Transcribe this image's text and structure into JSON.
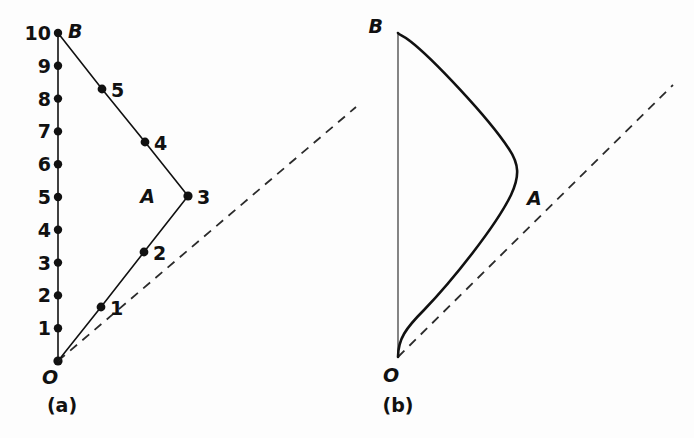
{
  "figure": {
    "background_color": "#fdfdfd",
    "ink_color": "#111111",
    "panels": [
      {
        "id": "a",
        "caption": "(a)",
        "caption_pos": {
          "x": 62,
          "y": 412
        },
        "axis": {
          "x": 58,
          "y_top": 33,
          "y_bottom": 361,
          "unit_px": 32.8
        },
        "tick_labels": [
          "10",
          "9",
          "8",
          "7",
          "6",
          "5",
          "4",
          "3",
          "2",
          "1"
        ],
        "tick_values": [
          10,
          9,
          8,
          7,
          6,
          5,
          4,
          3,
          2,
          1
        ],
        "vertices": [
          {
            "name": "O",
            "label": "O",
            "x": 58,
            "y": 361,
            "label_x": 50,
            "label_y": 384,
            "show_dot": true
          },
          {
            "name": "B",
            "label": "B",
            "x": 58,
            "y": 33,
            "label_x": 68,
            "label_y": 36,
            "show_dot": true
          },
          {
            "name": "A",
            "label": "A",
            "x": 188,
            "y": 196,
            "label_x": 155,
            "label_y": 202,
            "show_dot": true
          }
        ],
        "path_points": [
          {
            "label": "1",
            "x": 101,
            "y": 307,
            "label_x": 110,
            "label_y": 315
          },
          {
            "label": "2",
            "x": 144,
            "y": 252,
            "label_x": 153,
            "label_y": 260
          },
          {
            "label": "3",
            "x": 188,
            "y": 196,
            "label_x": 197,
            "label_y": 203
          },
          {
            "label": "4",
            "x": 145,
            "y": 142,
            "label_x": 154,
            "label_y": 149
          },
          {
            "label": "5",
            "x": 102,
            "y": 89,
            "label_x": 111,
            "label_y": 97
          }
        ],
        "polyline": "58,361 101,307 144,252 188,196 145,142 102,89 58,33",
        "dashed_line": {
          "x1": 58,
          "y1": 361,
          "x2": 356,
          "y2": 107
        }
      },
      {
        "id": "b",
        "caption": "(b)",
        "caption_pos": {
          "x": 398,
          "y": 412
        },
        "axis": {
          "x": 398,
          "y_top": 33,
          "y_bottom": 357
        },
        "vertices": [
          {
            "name": "O",
            "label": "O",
            "x": 398,
            "y": 357,
            "label_x": 389,
            "label_y": 381,
            "show_dot": false
          },
          {
            "name": "B",
            "label": "B",
            "x": 398,
            "y": 33,
            "label_x": 375,
            "label_y": 30,
            "show_dot": false
          },
          {
            "name": "A",
            "label": "A",
            "x": 517,
            "y": 176,
            "label_x": 527,
            "label_y": 205,
            "show_dot": false
          }
        ],
        "curve": "M 398,357 C 398,340 410,326 430,305 C 460,272 500,222 515,190 C 523,173 520,163 511,150 C 490,118 430,60 409,42 C 403,37 399,35 398,33",
        "dashed_line": {
          "x1": 398,
          "y1": 357,
          "x2": 673,
          "y2": 85
        }
      }
    ]
  }
}
